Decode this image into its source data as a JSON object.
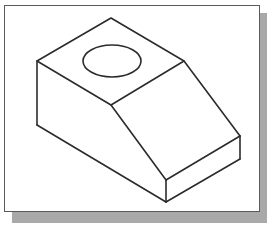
{
  "figure": {
    "type": "isometric-block-with-hole",
    "line_color": "#2b2b2b",
    "frame_border_color": "#5a5a5a",
    "shadow_color": "#a9a9a9",
    "background_color": "#ffffff",
    "vertices": {
      "top": [
        111,
        18
      ],
      "left": [
        37,
        61
      ],
      "top_right": [
        184,
        61
      ],
      "middle": [
        111,
        105
      ],
      "left_bottom": [
        37,
        125
      ],
      "front_top": [
        166,
        180
      ],
      "front_bottom": [
        166,
        202
      ],
      "right": [
        240,
        136
      ],
      "right_bottom": [
        240,
        159
      ]
    },
    "hole": {
      "cx": 112,
      "cy": 61,
      "rx": 29,
      "ry": 16
    }
  }
}
